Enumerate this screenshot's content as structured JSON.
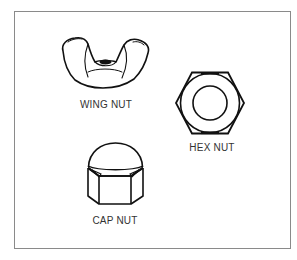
{
  "diagram": {
    "items": [
      {
        "id": "wing-nut",
        "label": "WING NUT"
      },
      {
        "id": "hex-nut",
        "label": "HEX NUT"
      },
      {
        "id": "cap-nut",
        "label": "CAP NUT"
      }
    ]
  },
  "colors": {
    "stroke": "#111111",
    "border": "#8a8a8a",
    "label": "#333333",
    "background": "#ffffff"
  }
}
